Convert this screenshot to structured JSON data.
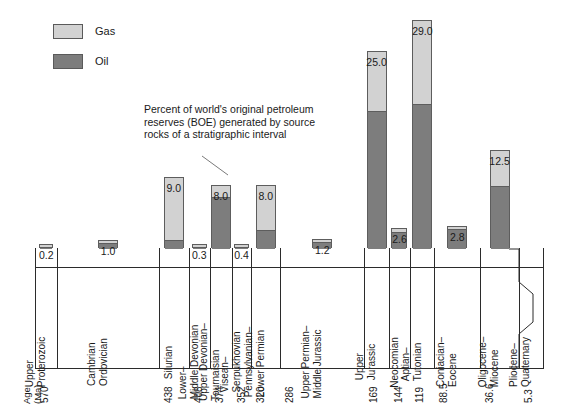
{
  "legend": {
    "items": [
      {
        "label": "Gas",
        "color": "#d2d2d2",
        "icon": "gas-swatch"
      },
      {
        "label": "Oil",
        "color": "#7d7d7d",
        "icon": "oil-swatch"
      }
    ]
  },
  "annotation": {
    "line1": "Percent of world's original petroleum",
    "line2": "reserves (BOE) generated by source",
    "line3": "rocks of a stratigraphic interval"
  },
  "axis": {
    "age_header_line1": "Age",
    "age_header_line2": "(Ma)",
    "age_ticks": [
      "570",
      "438",
      "408",
      "374",
      "352",
      "320",
      "286",
      "169",
      "144",
      "119",
      "88.5",
      "36.6",
      "5.3"
    ]
  },
  "chart_data": {
    "type": "bar",
    "title": "",
    "subtitle": "",
    "xlabel": "Age (Ma)",
    "ylabel": "Percent of world's original petroleum reserves (BOE)",
    "ylim": [
      0,
      29
    ],
    "grid": false,
    "legend_position": "top-left",
    "stacked": true,
    "categories": [
      "Upper Proterozoic",
      "Cambrian Ordovician",
      "Silurian",
      "Lower–Middle Devonian",
      "Upper Devonian–Tournaisian",
      "Visean–Serpukhovian",
      "Pennsylvanian–Lower Permian",
      "Upper Permian–Middle Jurassic",
      "Upper Jurassic",
      "Neocomian",
      "Aptian–Tutonian",
      "Coniacian–Eocene",
      "Oligocene–Miocene",
      "Pliocene–Quaternary"
    ],
    "totals": [
      0.2,
      1.0,
      9.0,
      0.3,
      8.0,
      0.4,
      8.0,
      1.2,
      25.0,
      2.6,
      29.0,
      2.8,
      12.5,
      0.0
    ],
    "value_labels": [
      "0.2",
      "1.0",
      "9.0",
      "0.3",
      "8.0",
      "0.4",
      "8.0",
      "1.2",
      "25.0",
      "2.6",
      "29.0",
      "2.8",
      "12.5",
      ""
    ],
    "series": [
      {
        "name": "Oil",
        "color": "#7d7d7d",
        "values": [
          0.15,
          0.8,
          1.1,
          0.05,
          6.6,
          0.08,
          2.4,
          0.9,
          17.5,
          2.1,
          18.5,
          2.5,
          8.0,
          0.0
        ]
      },
      {
        "name": "Gas",
        "color": "#d2d2d2",
        "values": [
          0.05,
          0.2,
          7.9,
          0.25,
          1.4,
          0.32,
          5.6,
          0.3,
          7.5,
          0.5,
          10.5,
          0.3,
          4.5,
          0.0
        ]
      }
    ],
    "age_boundaries": [
      "570",
      "438",
      "408",
      "374",
      "352",
      "320",
      "286",
      "169",
      "144",
      "119",
      "88.5",
      "36.6",
      "5.3"
    ]
  }
}
